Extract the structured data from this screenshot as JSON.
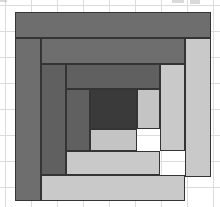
{
  "canvas": {
    "width": 220,
    "height": 207,
    "background": "#ffffff"
  },
  "background_grid": {
    "visible": true,
    "line_color": "#dcdcdc",
    "spacing_px": 26,
    "origin_x": 5,
    "origin_y": 5
  },
  "artifacts": [
    {
      "name": "cropped-text-mark-1",
      "x": 172,
      "y": 0,
      "width": 12,
      "height": 3,
      "color": "#b9b9b9"
    },
    {
      "name": "cropped-text-mark-2",
      "x": 190,
      "y": 0,
      "width": 10,
      "height": 4,
      "color": "#b9b9b9"
    },
    {
      "name": "cropped-text-mark-3",
      "x": 0,
      "y": 0,
      "width": 7,
      "height": 2,
      "color": "#b9b9b9"
    }
  ],
  "block": {
    "title": "Log Cabin Quilt Block",
    "x": 15,
    "y": 12,
    "width": 196,
    "height": 189,
    "stroke": "#343434",
    "stroke_width": 1,
    "palette": {
      "dark": "#6e6e6e",
      "dark_inner": "#606060",
      "dark_core": "#3a3a3a",
      "light": "#c9c9c9",
      "light_inner": "#c4c4c4"
    },
    "rings": 3,
    "patches": [
      {
        "id": "round1-top",
        "tone": "dark",
        "color": "#6e6e6e",
        "x": 0,
        "y": 0,
        "width": 196,
        "height": 26
      },
      {
        "id": "round1-left",
        "tone": "dark",
        "color": "#6e6e6e",
        "x": 0,
        "y": 26,
        "width": 26,
        "height": 163
      },
      {
        "id": "round1-right",
        "tone": "light",
        "color": "#c9c9c9",
        "x": 170,
        "y": 26,
        "width": 26,
        "height": 139
      },
      {
        "id": "round1-bottom",
        "tone": "light",
        "color": "#c9c9c9",
        "x": 26,
        "y": 163,
        "width": 144,
        "height": 26
      },
      {
        "id": "round2-top",
        "tone": "dark",
        "color": "#6e6e6e",
        "x": 26,
        "y": 26,
        "width": 144,
        "height": 26
      },
      {
        "id": "round2-left",
        "tone": "dark_inner",
        "color": "#606060",
        "x": 26,
        "y": 52,
        "width": 25,
        "height": 111
      },
      {
        "id": "round2-right",
        "tone": "light",
        "color": "#c9c9c9",
        "x": 145,
        "y": 52,
        "width": 25,
        "height": 87
      },
      {
        "id": "round2-bottom",
        "tone": "light",
        "color": "#c9c9c9",
        "x": 51,
        "y": 139,
        "width": 94,
        "height": 24
      },
      {
        "id": "round3-top",
        "tone": "dark_inner",
        "color": "#606060",
        "x": 51,
        "y": 52,
        "width": 94,
        "height": 25
      },
      {
        "id": "round3-left",
        "tone": "dark_inner",
        "color": "#606060",
        "x": 51,
        "y": 77,
        "width": 24,
        "height": 62
      },
      {
        "id": "round3-right",
        "tone": "light_inner",
        "color": "#c4c4c4",
        "x": 122,
        "y": 77,
        "width": 23,
        "height": 40
      },
      {
        "id": "round3-bottom",
        "tone": "light_inner",
        "color": "#c4c4c4",
        "x": 75,
        "y": 117,
        "width": 47,
        "height": 22
      },
      {
        "id": "center",
        "tone": "dark_core",
        "color": "#3a3a3a",
        "x": 75,
        "y": 77,
        "width": 47,
        "height": 40
      }
    ]
  }
}
